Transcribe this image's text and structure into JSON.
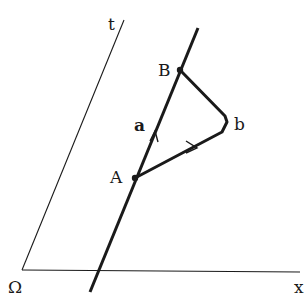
{
  "diagram": {
    "axes": {
      "time_label": "t",
      "space_label": "x",
      "origin_label": "Ω"
    },
    "events": [
      {
        "id": "A",
        "label": "A"
      },
      {
        "id": "B",
        "label": "B"
      }
    ],
    "paths": [
      {
        "id": "a",
        "label": "a",
        "from": "A",
        "to": "B",
        "kind": "straight worldline segment"
      },
      {
        "id": "b",
        "label": "b",
        "from": "A",
        "to": "B",
        "kind": "bent path via turning point"
      }
    ],
    "colors": {
      "ink": "#1a1a1a",
      "background": "#ffffff"
    }
  }
}
